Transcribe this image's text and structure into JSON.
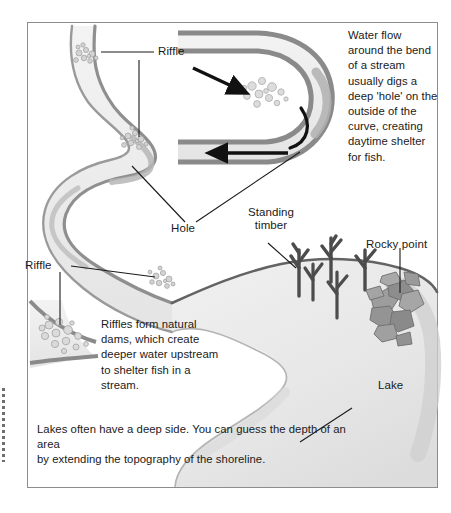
{
  "figure": {
    "frame_color": "#8d8d8d",
    "water_fill": "#ededed",
    "bank_color": "#8a8a8a",
    "shore_line_color": "#5f5f5f",
    "lake_fill": "#e9e9e9",
    "rock_color": "#9a9a9a",
    "timber_color": "#4a4a4a",
    "arrow_color": "#111111",
    "leader_color": "#1a1a1a",
    "pebble_color": "#c9c9c9"
  },
  "callouts": {
    "water_flow": "Water flow\naround the bend\nof a stream\nusually digs a\ndeep 'hole' on the\noutside of the\ncurve, creating\ndaytime shelter\nfor fish.",
    "riffles": "Riffles form natural\ndams, which create\ndeeper water upstream\nto shelter fish in a\nstream.",
    "lakes": "Lakes often have a deep side. You can guess the depth of an area\nby extending the topography of the shoreline."
  },
  "labels": {
    "riffle_top": "Riffle",
    "riffle_bottom": "Riffle",
    "hole": "Hole",
    "standing_timber": "Standing\ntimber",
    "rocky_point": "Rocky point",
    "lake": "Lake"
  },
  "icons": {
    "flow_arrow_upper": "arrow-right-icon",
    "flow_arrow_lower": "arrow-left-icon",
    "eddy_curve": "curved-flow-arrow-icon",
    "pebbles": "gravel-pebbles-icon",
    "timber": "standing-timber-icon",
    "rocks": "rock-pile-icon"
  }
}
